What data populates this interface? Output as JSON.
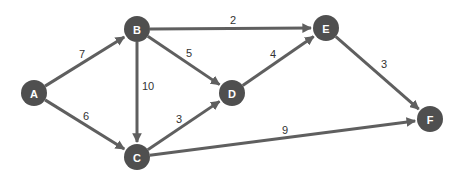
{
  "graph": {
    "type": "directed-weighted",
    "nodes": [
      {
        "id": "A",
        "label": "A",
        "x": 34,
        "y": 93
      },
      {
        "id": "B",
        "label": "B",
        "x": 137,
        "y": 29
      },
      {
        "id": "C",
        "label": "C",
        "x": 137,
        "y": 157
      },
      {
        "id": "D",
        "label": "D",
        "x": 232,
        "y": 93
      },
      {
        "id": "E",
        "label": "E",
        "x": 326,
        "y": 28
      },
      {
        "id": "F",
        "label": "F",
        "x": 430,
        "y": 119
      }
    ],
    "edges": [
      {
        "from": "A",
        "to": "B",
        "weight": "7",
        "lx": 82,
        "ly": 54
      },
      {
        "from": "A",
        "to": "C",
        "weight": "6",
        "lx": 86,
        "ly": 116
      },
      {
        "from": "B",
        "to": "E",
        "weight": "2",
        "lx": 233,
        "ly": 20
      },
      {
        "from": "B",
        "to": "D",
        "weight": "5",
        "lx": 189,
        "ly": 53
      },
      {
        "from": "B",
        "to": "C",
        "weight": "10",
        "lx": 148,
        "ly": 86
      },
      {
        "from": "C",
        "to": "D",
        "weight": "3",
        "lx": 179,
        "ly": 119
      },
      {
        "from": "D",
        "to": "E",
        "weight": "4",
        "lx": 273,
        "ly": 54
      },
      {
        "from": "E",
        "to": "F",
        "weight": "3",
        "lx": 384,
        "ly": 64
      },
      {
        "from": "C",
        "to": "F",
        "weight": "9",
        "lx": 285,
        "ly": 130
      }
    ]
  },
  "colors": {
    "node": "#4f4f4f",
    "edge": "#5f5f5f",
    "label": "#ffffff",
    "weight": "#333333"
  }
}
